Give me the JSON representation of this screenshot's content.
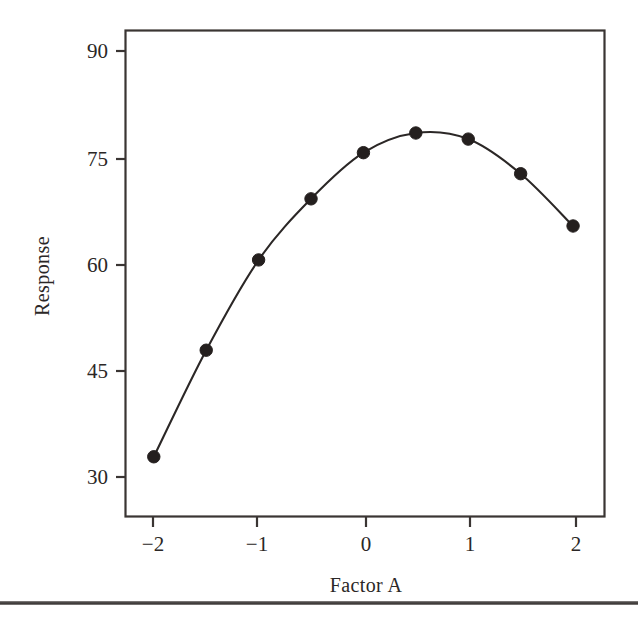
{
  "figure": {
    "background_color": "#ffffff",
    "ink_color": "#2b2726",
    "bottom_rule_color": "#4b4746"
  },
  "chart_data": {
    "type": "line",
    "title": "",
    "subtitle": "",
    "xlabel": "Factor A",
    "ylabel": "Response",
    "x": [
      -2,
      -1.5,
      -1,
      -0.5,
      0,
      0.5,
      1,
      1.5,
      2
    ],
    "values": [
      33,
      48.7,
      62,
      71,
      77.8,
      80.7,
      79.8,
      74.7,
      67
    ],
    "series": [
      {
        "name": "Response",
        "x": [
          -2,
          -1.5,
          -1,
          -0.5,
          0,
          0.5,
          1,
          1.5,
          2
        ],
        "values": [
          33,
          48.7,
          62,
          71,
          77.8,
          80.7,
          79.8,
          74.7,
          67
        ],
        "marker": "filled-circle",
        "line_style": "solid"
      }
    ],
    "xlim": [
      -2.27,
      2.3
    ],
    "ylim": [
      24.2,
      95.8
    ],
    "xticks": [
      -2,
      -1,
      0,
      1,
      2
    ],
    "xticklabels": [
      "−2",
      "−1",
      "0",
      "1",
      "2"
    ],
    "yticks": [
      30,
      45,
      60,
      75,
      90
    ],
    "yticklabels": [
      "30",
      "45",
      "60",
      "75",
      "90"
    ],
    "grid": false,
    "legend": null,
    "legend_position": "none",
    "frame": "box",
    "annotations": []
  }
}
